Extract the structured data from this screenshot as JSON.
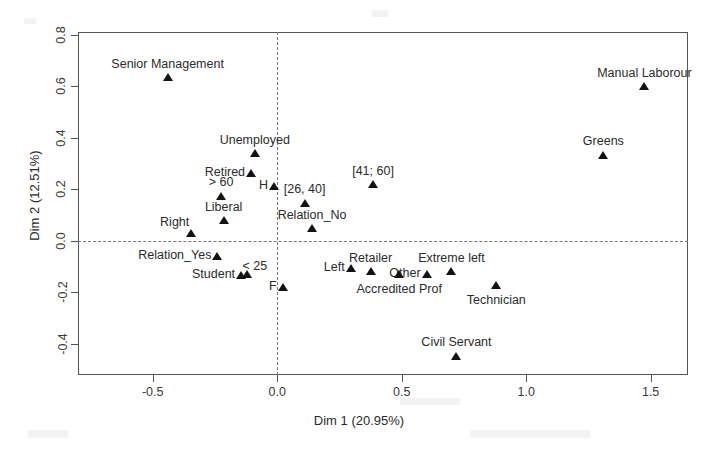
{
  "chart_data": {
    "type": "scatter",
    "title": "",
    "xlabel": "Dim 1 (20.95%)",
    "ylabel": "Dim 2 (12.51%)",
    "xlim": [
      -0.8,
      1.65
    ],
    "ylim": [
      -0.52,
      0.81
    ],
    "xticks": [
      -0.5,
      0.0,
      0.5,
      1.0,
      1.5
    ],
    "xticklabels": [
      "-0.5",
      "0.0",
      "0.5",
      "1.0",
      "1.5"
    ],
    "yticks": [
      -0.4,
      -0.2,
      0.0,
      0.2,
      0.4,
      0.6,
      0.8
    ],
    "yticklabels": [
      "-0.4",
      "-0.2",
      "0.0",
      "0.2",
      "0.4",
      "0.6",
      "0.8"
    ],
    "grid": false,
    "legend": "none",
    "reference_lines": [
      {
        "axis": "horizontal",
        "value": 0.0,
        "style": "dashed"
      },
      {
        "axis": "vertical",
        "value": 0.0,
        "style": "dashed"
      }
    ],
    "marker": "filled-triangle",
    "marker_color": "#131313",
    "points": [
      {
        "label": "Senior Management",
        "x": -0.44,
        "y": 0.635,
        "labelpos": "above"
      },
      {
        "label": "Manual Laborour",
        "x": 1.475,
        "y": 0.6,
        "labelpos": "above"
      },
      {
        "label": "Greens",
        "x": 1.31,
        "y": 0.335,
        "labelpos": "above"
      },
      {
        "label": "Unemployed",
        "x": -0.09,
        "y": 0.34,
        "labelpos": "above"
      },
      {
        "label": "Retired",
        "x": -0.105,
        "y": 0.265,
        "labelpos": "left"
      },
      {
        "label": "[41; 60]",
        "x": 0.385,
        "y": 0.22,
        "labelpos": "above"
      },
      {
        "label": "H",
        "x": -0.013,
        "y": 0.212,
        "labelpos": "left"
      },
      {
        "label": "> 60",
        "x": -0.225,
        "y": 0.175,
        "labelpos": "above"
      },
      {
        "label": "[26, 40]",
        "x": 0.11,
        "y": 0.148,
        "labelpos": "above"
      },
      {
        "label": "Liberal",
        "x": -0.215,
        "y": 0.08,
        "labelpos": "above"
      },
      {
        "label": "Relation_No",
        "x": 0.14,
        "y": 0.05,
        "labelpos": "above"
      },
      {
        "label": "Right",
        "x": -0.345,
        "y": 0.03,
        "labelpos": "above-left"
      },
      {
        "label": "Relation_Yes",
        "x": -0.24,
        "y": -0.058,
        "labelpos": "left"
      },
      {
        "label": "Left",
        "x": 0.295,
        "y": -0.105,
        "labelpos": "left"
      },
      {
        "label": "Retailer",
        "x": 0.375,
        "y": -0.118,
        "labelpos": "above"
      },
      {
        "label": "Other",
        "x": 0.6,
        "y": -0.13,
        "labelpos": "left"
      },
      {
        "label": "Extreme left",
        "x": 0.7,
        "y": -0.118,
        "labelpos": "above"
      },
      {
        "label": "< 25",
        "x": -0.123,
        "y": -0.128,
        "labelpos": "above-right"
      },
      {
        "label": "Student",
        "x": -0.145,
        "y": -0.132,
        "labelpos": "left"
      },
      {
        "label": "Accredited Prof",
        "x": 0.49,
        "y": -0.128,
        "labelpos": "below"
      },
      {
        "label": "Technician",
        "x": 0.88,
        "y": -0.17,
        "labelpos": "below"
      },
      {
        "label": "F",
        "x": 0.022,
        "y": -0.178,
        "labelpos": "left"
      },
      {
        "label": "Civil Servant",
        "x": 0.72,
        "y": -0.445,
        "labelpos": "above"
      }
    ]
  }
}
